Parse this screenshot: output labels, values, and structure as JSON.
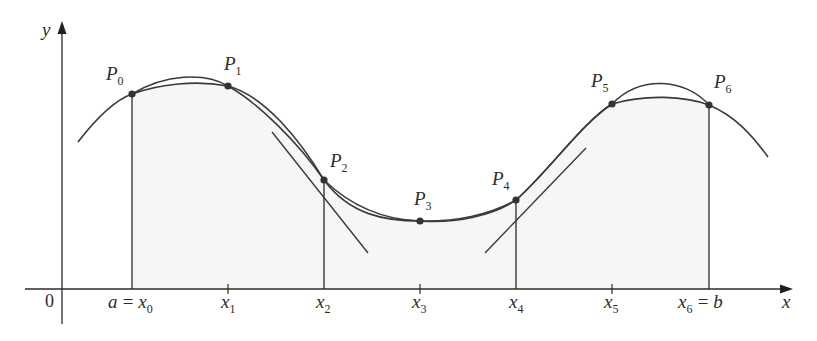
{
  "diagram": {
    "colors": {
      "ink": "#3a3a3a",
      "shade": "#f6f6f6",
      "point": "#333333"
    },
    "axes": {
      "x_label": "x",
      "y_label": "y",
      "origin_label": "0"
    },
    "x_ticks": [
      {
        "main": "a",
        "eq": "=",
        "var": "x",
        "sub": "0"
      },
      {
        "var": "x",
        "sub": "1"
      },
      {
        "var": "x",
        "sub": "2"
      },
      {
        "var": "x",
        "sub": "3"
      },
      {
        "var": "x",
        "sub": "4"
      },
      {
        "var": "x",
        "sub": "5"
      },
      {
        "var": "x",
        "sub": "6",
        "eq": "=",
        "main": "b"
      }
    ],
    "points": [
      {
        "name": "P",
        "sub": "0"
      },
      {
        "name": "P",
        "sub": "1"
      },
      {
        "name": "P",
        "sub": "2"
      },
      {
        "name": "P",
        "sub": "3"
      },
      {
        "name": "P",
        "sub": "4"
      },
      {
        "name": "P",
        "sub": "5"
      },
      {
        "name": "P",
        "sub": "6"
      }
    ]
  }
}
